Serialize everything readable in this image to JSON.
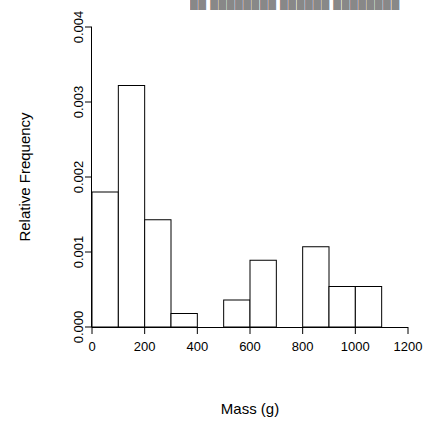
{
  "chart_data": {
    "type": "bar",
    "title": "",
    "xlabel": "Mass (g)",
    "ylabel": "Relative Frequency",
    "grid": false,
    "legend": null,
    "bin_width": 100,
    "bin_edges": [
      0,
      100,
      200,
      300,
      400,
      500,
      600,
      700,
      800,
      900,
      1000,
      1100
    ],
    "categories": [
      "0-100",
      "100-200",
      "200-300",
      "300-400",
      "400-500",
      "500-600",
      "600-700",
      "700-800",
      "800-900",
      "900-1000",
      "1000-1100"
    ],
    "values": [
      0.0018,
      0.00322,
      0.00143,
      0.00018,
      0.0,
      0.00036,
      0.00089,
      0.0,
      0.00107,
      0.00054,
      0.00054
    ],
    "xlim": [
      0,
      1200
    ],
    "ylim": [
      0,
      0.004
    ],
    "xticks": [
      0,
      200,
      400,
      600,
      800,
      1000,
      1200
    ],
    "xticklabels": [
      "0",
      "200",
      "400",
      "600",
      "800",
      "1000",
      "1200"
    ],
    "yticks": [
      0,
      0.001,
      0.002,
      0.003,
      0.004
    ],
    "yticklabels": [
      "0.000",
      "0.001",
      "0.002",
      "0.003",
      "0.004"
    ],
    "bar_fill": "#ffffff",
    "bar_stroke": "#000000",
    "axis_color": "#000000"
  },
  "overlay": {
    "clipped_header_text": "██ ████████ ██████ ████████"
  }
}
